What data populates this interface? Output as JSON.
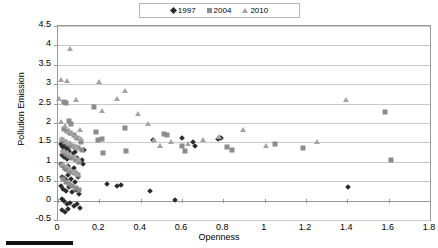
{
  "legend": {
    "position": "top-center",
    "entries": [
      {
        "label": "1997",
        "marker": "diamond-icon",
        "color": "#2b2b2b"
      },
      {
        "label": "2004",
        "marker": "square-icon",
        "color": "#8c8c8c"
      },
      {
        "label": "2010",
        "marker": "triangle-icon",
        "color": "#a3a3a3"
      }
    ]
  },
  "axes": {
    "ylabel": "Pollution Emission",
    "xlabel": "Openness",
    "yticks": [
      "-0.5",
      "0",
      "0.5",
      "1",
      "1.5",
      "2",
      "2.5",
      "3",
      "3.5",
      "4",
      "4.5"
    ],
    "xticks": [
      "0",
      "0.2",
      "0.4",
      "0.6",
      "0.8",
      "1",
      "1.2",
      "1.4",
      "1.6",
      "1.8"
    ]
  },
  "chart_data": {
    "type": "scatter",
    "title": "",
    "xlabel": "Openness",
    "ylabel": "Pollution Emission",
    "xlim": [
      0,
      1.8
    ],
    "ylim": [
      -0.5,
      4.5
    ],
    "xtick_step": 0.2,
    "ytick_step": 0.5,
    "grid": "horizontal",
    "legend_position": "top-center",
    "series": [
      {
        "name": "1997",
        "marker": "diamond",
        "color": "#2b2b2b",
        "points": [
          [
            0.015,
            1.45
          ],
          [
            0.02,
            1.42
          ],
          [
            0.025,
            1.38
          ],
          [
            0.03,
            1.47
          ],
          [
            0.035,
            1.33
          ],
          [
            0.04,
            1.4
          ],
          [
            0.05,
            1.35
          ],
          [
            0.055,
            1.28
          ],
          [
            0.02,
            1.18
          ],
          [
            0.03,
            1.12
          ],
          [
            0.045,
            1.08
          ],
          [
            0.06,
            1.15
          ],
          [
            0.07,
            1.2
          ],
          [
            0.08,
            1.25
          ],
          [
            0.09,
            1.1
          ],
          [
            0.015,
            0.95
          ],
          [
            0.025,
            0.88
          ],
          [
            0.035,
            0.82
          ],
          [
            0.05,
            0.9
          ],
          [
            0.06,
            0.78
          ],
          [
            0.075,
            0.85
          ],
          [
            0.085,
            0.72
          ],
          [
            0.02,
            0.62
          ],
          [
            0.03,
            0.58
          ],
          [
            0.04,
            0.52
          ],
          [
            0.05,
            0.65
          ],
          [
            0.065,
            0.55
          ],
          [
            0.08,
            0.48
          ],
          [
            0.095,
            0.6
          ],
          [
            0.015,
            0.38
          ],
          [
            0.025,
            0.3
          ],
          [
            0.04,
            0.25
          ],
          [
            0.055,
            0.35
          ],
          [
            0.07,
            0.22
          ],
          [
            0.085,
            0.28
          ],
          [
            0.1,
            0.18
          ],
          [
            0.02,
            0.05
          ],
          [
            0.03,
            -0.02
          ],
          [
            0.045,
            -0.1
          ],
          [
            0.06,
            -0.05
          ],
          [
            0.075,
            -0.14
          ],
          [
            0.09,
            -0.08
          ],
          [
            0.105,
            -0.18
          ],
          [
            0.02,
            -0.25
          ],
          [
            0.035,
            -0.3
          ],
          [
            0.05,
            -0.22
          ],
          [
            0.115,
            1.05
          ],
          [
            0.12,
            0.95
          ],
          [
            0.125,
            1.3
          ],
          [
            0.235,
            0.42
          ],
          [
            0.285,
            0.38
          ],
          [
            0.305,
            0.4
          ],
          [
            0.445,
            0.25
          ],
          [
            0.565,
            0.02
          ],
          [
            0.46,
            1.55
          ],
          [
            0.6,
            1.62
          ],
          [
            0.655,
            1.52
          ],
          [
            0.665,
            1.42
          ],
          [
            0.775,
            1.58
          ],
          [
            0.79,
            1.62
          ],
          [
            1.405,
            0.35
          ]
        ]
      },
      {
        "name": "2004",
        "marker": "square",
        "color": "#8c8c8c",
        "points": [
          [
            0.03,
            2.55
          ],
          [
            0.04,
            2.52
          ],
          [
            0.055,
            2.05
          ],
          [
            0.065,
            1.98
          ],
          [
            0.03,
            1.85
          ],
          [
            0.045,
            1.8
          ],
          [
            0.06,
            1.75
          ],
          [
            0.075,
            1.68
          ],
          [
            0.09,
            1.62
          ],
          [
            0.02,
            1.55
          ],
          [
            0.035,
            1.5
          ],
          [
            0.05,
            1.45
          ],
          [
            0.065,
            1.42
          ],
          [
            0.08,
            1.38
          ],
          [
            0.095,
            1.35
          ],
          [
            0.025,
            1.25
          ],
          [
            0.04,
            1.2
          ],
          [
            0.055,
            1.15
          ],
          [
            0.07,
            1.1
          ],
          [
            0.085,
            1.05
          ],
          [
            0.1,
            1.0
          ],
          [
            0.02,
            0.92
          ],
          [
            0.035,
            0.85
          ],
          [
            0.05,
            0.8
          ],
          [
            0.065,
            0.75
          ],
          [
            0.08,
            0.7
          ],
          [
            0.095,
            0.65
          ],
          [
            0.025,
            0.55
          ],
          [
            0.04,
            0.48
          ],
          [
            0.055,
            0.42
          ],
          [
            0.07,
            0.38
          ],
          [
            0.085,
            0.32
          ],
          [
            0.1,
            0.28
          ],
          [
            0.11,
            1.52
          ],
          [
            0.115,
            1.3
          ],
          [
            0.175,
            2.42
          ],
          [
            0.185,
            1.78
          ],
          [
            0.195,
            1.55
          ],
          [
            0.215,
            1.6
          ],
          [
            0.22,
            1.22
          ],
          [
            0.325,
            1.88
          ],
          [
            0.33,
            1.28
          ],
          [
            0.515,
            1.72
          ],
          [
            0.525,
            1.7
          ],
          [
            0.6,
            1.42
          ],
          [
            0.615,
            1.28
          ],
          [
            0.82,
            1.38
          ],
          [
            0.84,
            1.3
          ],
          [
            1.05,
            1.45
          ],
          [
            1.185,
            1.35
          ],
          [
            1.58,
            2.28
          ],
          [
            1.61,
            1.05
          ]
        ]
      },
      {
        "name": "2010",
        "marker": "triangle",
        "color": "#a3a3a3",
        "points": [
          [
            0.06,
            3.92
          ],
          [
            0.015,
            3.12
          ],
          [
            0.045,
            3.08
          ],
          [
            0.005,
            2.62
          ],
          [
            0.085,
            2.58
          ],
          [
            0.015,
            2.02
          ],
          [
            0.035,
            1.92
          ],
          [
            0.055,
            1.8
          ],
          [
            0.07,
            1.72
          ],
          [
            0.085,
            1.65
          ],
          [
            0.02,
            1.58
          ],
          [
            0.04,
            1.52
          ],
          [
            0.06,
            1.48
          ],
          [
            0.075,
            1.42
          ],
          [
            0.09,
            1.36
          ],
          [
            0.03,
            1.28
          ],
          [
            0.05,
            1.22
          ],
          [
            0.065,
            1.18
          ],
          [
            0.08,
            1.12
          ],
          [
            0.095,
            1.05
          ],
          [
            0.025,
            0.95
          ],
          [
            0.045,
            0.88
          ],
          [
            0.06,
            0.82
          ],
          [
            0.075,
            0.75
          ],
          [
            0.09,
            0.68
          ],
          [
            0.105,
            1.82
          ],
          [
            0.11,
            1.58
          ],
          [
            0.2,
            3.05
          ],
          [
            0.215,
            2.32
          ],
          [
            0.285,
            2.62
          ],
          [
            0.325,
            2.82
          ],
          [
            0.385,
            2.22
          ],
          [
            0.435,
            1.98
          ],
          [
            0.465,
            1.55
          ],
          [
            0.495,
            1.42
          ],
          [
            0.545,
            1.52
          ],
          [
            0.63,
            1.45
          ],
          [
            0.7,
            1.55
          ],
          [
            0.78,
            1.65
          ],
          [
            0.895,
            1.82
          ],
          [
            1.005,
            1.42
          ],
          [
            1.255,
            1.52
          ],
          [
            1.395,
            2.58
          ]
        ]
      }
    ]
  }
}
